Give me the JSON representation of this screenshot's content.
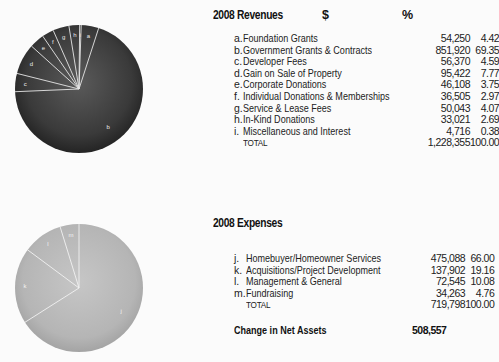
{
  "revenues": {
    "title": "2008 Revenues",
    "col_amount": "$",
    "col_percent": "%",
    "rows": [
      {
        "letter": "a.",
        "label": "Foundation Grants",
        "amount": "54,250",
        "percent": "4.42"
      },
      {
        "letter": "b.",
        "label": "Government Grants & Contracts",
        "amount": "851,920",
        "percent": "69.35"
      },
      {
        "letter": "c.",
        "label": "Developer Fees",
        "amount": "56,370",
        "percent": "4.59"
      },
      {
        "letter": "d.",
        "label": "Gain on Sale of Property",
        "amount": "95,422",
        "percent": "7.77"
      },
      {
        "letter": "e.",
        "label": "Corporate Donations",
        "amount": "46,108",
        "percent": "3.75"
      },
      {
        "letter": "f.",
        "label": "Individual Donations & Memberships",
        "amount": "36,505",
        "percent": "2.97"
      },
      {
        "letter": "g.",
        "label": "Service & Lease Fees",
        "amount": "50,043",
        "percent": "4.07"
      },
      {
        "letter": "h.",
        "label": "In-Kind Donations",
        "amount": "33,021",
        "percent": "2.69"
      },
      {
        "letter": "i.",
        "label": "Miscellaneous and Interest",
        "amount": "4,716",
        "percent": "0.38"
      }
    ],
    "total": {
      "label": "TOTAL",
      "amount": "1,228,355",
      "percent": "100.00"
    },
    "pie_color": "#3c3c3c"
  },
  "expenses": {
    "title": "2008 Expenses",
    "rows": [
      {
        "letter": "j.",
        "label": "Homebuyer/Homeowner Services",
        "amount": "475,088",
        "percent": "66.00"
      },
      {
        "letter": "k.",
        "label": "Acquisitions/Project Development",
        "amount": "137,902",
        "percent": "19.16"
      },
      {
        "letter": "l.",
        "label": "Management & General",
        "amount": "72,545",
        "percent": "10.08"
      },
      {
        "letter": "m.",
        "label": "Fundraising",
        "amount": "34,263",
        "percent": "4.76"
      }
    ],
    "total": {
      "label": "TOTAL",
      "amount": "719,798",
      "percent": "100.00"
    },
    "net_change": {
      "label": "Change in Net Assets",
      "amount": "508,557"
    },
    "pie_color": "#b9b9b9"
  },
  "chart_data": [
    {
      "type": "pie",
      "title": "2008 Revenues",
      "categories": [
        "a",
        "b",
        "c",
        "d",
        "e",
        "f",
        "g",
        "h",
        "i"
      ],
      "labels": [
        "Foundation Grants",
        "Government Grants & Contracts",
        "Developer Fees",
        "Gain on Sale of Property",
        "Corporate Donations",
        "Individual Donations & Memberships",
        "Service & Lease Fees",
        "In-Kind Donations",
        "Miscellaneous and Interest"
      ],
      "values": [
        4.42,
        69.35,
        4.59,
        7.77,
        3.75,
        2.97,
        4.07,
        2.69,
        0.38
      ]
    },
    {
      "type": "pie",
      "title": "2008 Expenses",
      "categories": [
        "j",
        "k",
        "l",
        "m"
      ],
      "labels": [
        "Homebuyer/Homeowner Services",
        "Acquisitions/Project Development",
        "Management & General",
        "Fundraising"
      ],
      "values": [
        66.0,
        19.16,
        10.08,
        4.76
      ]
    }
  ]
}
